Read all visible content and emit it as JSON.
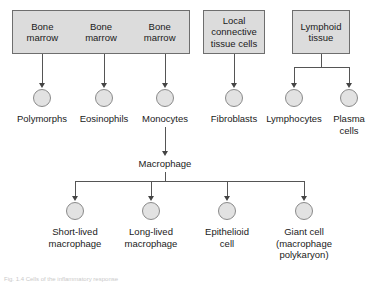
{
  "figure": {
    "caption": "Fig. 1.4 Cells of the inflammatory response"
  },
  "sources": [
    {
      "id": "bone-marrow-group",
      "segments": [
        "Bone\nmarrow",
        "Bone\nmarrow",
        "Bone\nmarrow"
      ]
    },
    {
      "id": "local-connective-tissue-cells",
      "segments": [
        "Local\nconnective\ntissue cells"
      ]
    },
    {
      "id": "lymphoid-tissue",
      "segments": [
        "Lymphoid\ntissue"
      ]
    }
  ],
  "cell_row": {
    "items": [
      {
        "label": "Polymorphs"
      },
      {
        "label": "Eosinophils"
      },
      {
        "label": "Monocytes"
      },
      {
        "label": "Fibroblasts"
      },
      {
        "label": "Lymphocytes"
      },
      {
        "label": "Plasma\ncells"
      }
    ]
  },
  "intermediate": {
    "label": "Macrophage"
  },
  "derivative_row": {
    "items": [
      {
        "label": "Short-lived\nmacrophage"
      },
      {
        "label": "Long-lived\nmacrophage"
      },
      {
        "label": "Epithelioid\ncell"
      },
      {
        "label": "Giant cell\n(macrophage\npolykaryon)"
      }
    ]
  },
  "colors": {
    "box_fill": "#dcdcdc",
    "box_border": "#6e6e6e",
    "cell_fill": "#e2e2e2",
    "cell_border": "#8a8a8a",
    "connector": "#555555",
    "text": "#1a1a1a"
  }
}
